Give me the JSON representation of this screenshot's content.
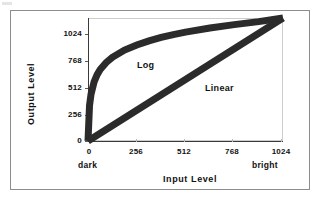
{
  "chart_data": {
    "type": "line",
    "title": "",
    "xlabel": "Input Level",
    "ylabel": "Output Level",
    "xlim": [
      0,
      1024
    ],
    "ylim": [
      0,
      1024
    ],
    "xticks": [
      "0",
      "256",
      "512",
      "768",
      "1024"
    ],
    "yticks": [
      "0",
      "256",
      "512",
      "768",
      "1024"
    ],
    "xtick_values": [
      0,
      256,
      512,
      768,
      1024
    ],
    "ytick_values": [
      0,
      256,
      512,
      768,
      1024
    ],
    "grid": false,
    "legend_position": "inline-annotations",
    "axis_end_labels": {
      "x_low": "dark",
      "x_high": "bright"
    },
    "annotations": [
      {
        "text": "Log",
        "x": 300,
        "y": 800
      },
      {
        "text": "Linear",
        "x": 640,
        "y": 500
      }
    ],
    "series": [
      {
        "name": "Log",
        "color": "#2b2b2b",
        "x": [
          0,
          8,
          16,
          32,
          48,
          64,
          96,
          128,
          192,
          256,
          320,
          384,
          448,
          512,
          640,
          768,
          896,
          1024
        ],
        "y": [
          0,
          296,
          390,
          492,
          552,
          595,
          654,
          697,
          757,
          800,
          834,
          862,
          886,
          906,
          941,
          969,
          994,
          1024
        ]
      },
      {
        "name": "Linear",
        "color": "#2b2b2b",
        "x": [
          0,
          1024
        ],
        "y": [
          0,
          1024
        ]
      }
    ]
  }
}
